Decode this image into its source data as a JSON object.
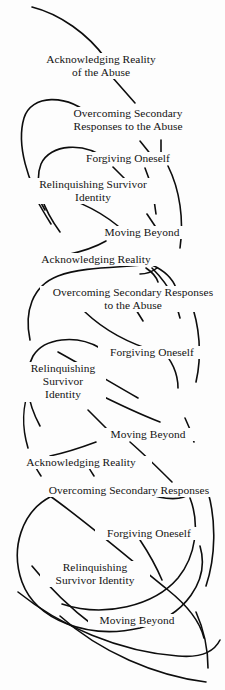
{
  "figure": {
    "width": 225,
    "height": 690,
    "background_color": "#fdfdfd",
    "ink_color": "#131313",
    "stroke_color": "#0d0d0d"
  },
  "cycles": [
    {
      "index": 1,
      "stages": [
        {
          "id": "c1-acknowledging",
          "lines": "Acknowledging Reality\nof the Abuse",
          "x": 27,
          "y": 53,
          "width": 146
        },
        {
          "id": "c1-overcoming",
          "lines": "Overcoming Secondary\nResponses to the Abuse",
          "x": 52,
          "y": 107,
          "width": 150
        },
        {
          "id": "c1-forgiving",
          "lines": "Forgiving Oneself",
          "x": 74,
          "y": 152,
          "width": 106
        },
        {
          "id": "c1-relinquishing",
          "lines": "Relinquishing Survivor\nIdentity",
          "x": 20,
          "y": 178,
          "width": 144
        },
        {
          "id": "c1-moving",
          "lines": "Moving Beyond",
          "x": 93,
          "y": 226,
          "width": 96
        }
      ]
    },
    {
      "index": 2,
      "stages": [
        {
          "id": "c2-acknowledging",
          "lines": "Acknowledging Reality",
          "x": 25,
          "y": 253,
          "width": 140
        },
        {
          "id": "c2-overcoming",
          "lines": "Overcoming Secondary Responses\nto the Abuse",
          "x": 40,
          "y": 286,
          "width": 184
        },
        {
          "id": "c2-forgiving",
          "lines": "Forgiving Oneself",
          "x": 98,
          "y": 346,
          "width": 106
        },
        {
          "id": "c2-relinquishing",
          "lines": "Relinquishing\nSurvivor\nIdentity",
          "x": 20,
          "y": 362,
          "width": 84
        },
        {
          "id": "c2-moving",
          "lines": "Moving Beyond",
          "x": 99,
          "y": 428,
          "width": 96
        }
      ]
    },
    {
      "index": 3,
      "stages": [
        {
          "id": "c3-acknowledging",
          "lines": "Acknowledging Reality",
          "x": 10,
          "y": 456,
          "width": 140
        },
        {
          "id": "c3-overcoming",
          "lines": "Overcoming Secondary Responses",
          "x": 33,
          "y": 484,
          "width": 190
        },
        {
          "id": "c3-forgiving",
          "lines": "Forgiving Oneself",
          "x": 95,
          "y": 527,
          "width": 106
        },
        {
          "id": "c3-relinquishing",
          "lines": "Relinquishing\nSurvivor Identity",
          "x": 40,
          "y": 561,
          "width": 108
        },
        {
          "id": "c3-moving",
          "lines": "Moving Beyond",
          "x": 88,
          "y": 614,
          "width": 96
        }
      ]
    }
  ],
  "curves": [
    {
      "id": "arc-top-entry",
      "d": "M 32 7 C 60 14, 88 34, 106 59"
    },
    {
      "id": "arc-c1-ack-to-over",
      "d": "M 113 78 C 120 86, 128 95, 135 103"
    },
    {
      "id": "arc-c1-left-loop-outer",
      "d": "M 94 118 C 66 92, 31 95, 24 118 C 16 145, 28 182, 45 210"
    },
    {
      "id": "arc-c1-left-loop-inner",
      "d": "M 108 160 C 84 141, 50 144, 41 164 C 33 184, 44 210, 60 232"
    },
    {
      "id": "arc-c1-over-tick-a",
      "d": "M 140 141 C 144 146, 148 151, 152 156"
    },
    {
      "id": "arc-c1-over-tick-b",
      "d": "M 161 140 C 161 146, 161 151, 161 156"
    },
    {
      "id": "arc-c1-forg-tick",
      "d": "M 113 167 C 118 172, 123 177, 128 182"
    },
    {
      "id": "arc-c1-forg-to-relin",
      "d": "M 145 168 C 150 180, 154 196, 156 214"
    },
    {
      "id": "arc-c1-right-sweep",
      "d": "M 168 166 C 180 190, 184 220, 180 248"
    },
    {
      "id": "arc-c1-relin-tick",
      "d": "M 37 200 C 41 208, 46 216, 51 224"
    },
    {
      "id": "arc-c1-mid-cross",
      "d": "M 44 193 C 68 196, 96 208, 118 226"
    },
    {
      "id": "arc-c1-move-tick",
      "d": "M 147 214 C 151 220, 155 226, 159 232"
    },
    {
      "id": "arc-c1-to-c2",
      "d": "M 106 241 C 94 248, 80 252, 66 255"
    },
    {
      "id": "arc-c2-ack-loop-outer",
      "d": "M 152 264 C 124 268, 84 266, 58 276 C 32 286, 24 312, 30 340"
    },
    {
      "id": "arc-c2-ack-right-hook",
      "d": "M 152 265 C 163 270, 172 277, 176 288"
    },
    {
      "id": "arc-c2-ack-right-spur",
      "d": "M 152 268 C 160 276, 168 286, 174 298"
    },
    {
      "id": "arc-c2-ack-arrowhead",
      "d": "M 146 268 C 152 272, 156 276, 158 282"
    },
    {
      "id": "arc-c2-ack-arrow-left",
      "d": "M 140 274 C 146 274, 152 272, 157 268"
    },
    {
      "id": "arc-c2-over-tick-a",
      "d": "M 128 297 C 133 305, 138 313, 143 321"
    },
    {
      "id": "arc-c2-over-tick-b",
      "d": "M 174 296 C 176 304, 178 311, 180 318"
    },
    {
      "id": "arc-c2-over-right-drop",
      "d": "M 190 300 C 200 326, 202 356, 196 382"
    },
    {
      "id": "arc-c2-over-to-forg",
      "d": "M 85 312 C 104 330, 130 344, 158 352"
    },
    {
      "id": "arc-c2-forg-hook",
      "d": "M 160 348 C 172 360, 178 374, 178 388"
    },
    {
      "id": "arc-c2-left-loop",
      "d": "M 100 348 C 76 334, 44 338, 33 356 C 22 376, 28 404, 40 426"
    },
    {
      "id": "arc-c2-relin-cross",
      "d": "M 58 352 C 80 364, 110 382, 138 398"
    },
    {
      "id": "arc-c2-relin-to-move",
      "d": "M 90 390 C 110 400, 134 412, 160 422"
    },
    {
      "id": "arc-c2-relin-tick",
      "d": "M 88 410 C 94 416, 100 422, 106 428"
    },
    {
      "id": "arc-c2-left-tail",
      "d": "M 30 388 C 22 406, 22 428, 28 448"
    },
    {
      "id": "arc-c2-move-tick",
      "d": "M 185 418 C 189 426, 192 434, 194 442"
    },
    {
      "id": "arc-c2-to-c3",
      "d": "M 96 442 C 80 448, 64 453, 50 456"
    },
    {
      "id": "arc-c3-ack-tick-a",
      "d": "M 35 466 C 37 470, 39 473, 41 476"
    },
    {
      "id": "arc-c3-ack-tick-b",
      "d": "M 88 466 C 90 470, 92 473, 94 476"
    },
    {
      "id": "arc-c3-move2-to-over",
      "d": "M 130 442 C 146 456, 160 470, 172 482"
    },
    {
      "id": "arc-c3-big-loop-outer",
      "d": "M 50 497 C 22 512, 10 548, 22 582 C 36 620, 88 640, 140 628 C 186 616, 210 580, 200 546"
    },
    {
      "id": "arc-c3-over-hook-right",
      "d": "M 142 492 C 164 500, 182 502, 192 492"
    },
    {
      "id": "arc-c3-right-drop",
      "d": "M 208 492 C 216 520, 216 556, 206 586"
    },
    {
      "id": "arc-c3-loop-diag",
      "d": "M 50 496 C 84 520, 126 556, 168 590 C 188 606, 200 622, 204 638"
    },
    {
      "id": "arc-c3-forg-tick",
      "d": "M 140 540 C 148 552, 156 566, 162 580"
    },
    {
      "id": "arc-c3-inner-loop",
      "d": "M 190 498 C 200 524, 196 556, 178 578 C 154 606, 104 618, 62 604"
    },
    {
      "id": "arc-c3-bottom-sweep",
      "d": "M 18 592 C 60 626, 120 652, 178 656 C 200 658, 214 652, 220 640"
    },
    {
      "id": "arc-c3-bottom-tail",
      "d": "M 60 616 C 100 652, 156 676, 206 682"
    },
    {
      "id": "arc-c3-relin-spur",
      "d": "M 32 566 C 48 586, 70 608, 94 626"
    },
    {
      "id": "arc-c3-move-spur",
      "d": "M 196 612 C 204 630, 208 650, 208 668"
    }
  ]
}
